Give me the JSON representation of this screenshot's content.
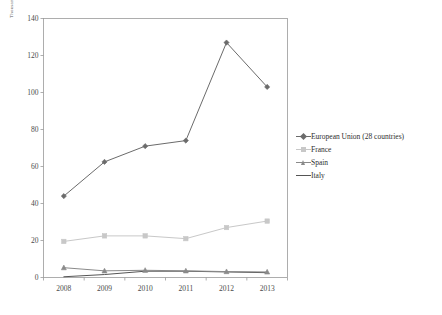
{
  "chart_data": {
    "type": "line",
    "title": "",
    "xlabel": "",
    "ylabel": "Thousands",
    "categories": [
      "2008",
      "2009",
      "2010",
      "2011",
      "2012",
      "2013"
    ],
    "ylim": [
      0,
      140
    ],
    "ytick_step": 20,
    "yticks": [
      "0",
      "20",
      "40",
      "60",
      "80",
      "100",
      "120",
      "140"
    ],
    "grid": false,
    "legend_position": "right",
    "series": [
      {
        "name": "European Union (28 countries)",
        "color": "#6b6b6b",
        "marker": "diamond",
        "values": [
          44,
          62.5,
          71,
          74,
          127,
          103
        ]
      },
      {
        "name": "France",
        "color": "#c8c8c8",
        "marker": "square",
        "values": [
          19.5,
          22.5,
          22.5,
          21,
          27,
          30.5
        ]
      },
      {
        "name": "Spain",
        "color": "#8a8a8a",
        "marker": "triangle",
        "values": [
          5.3,
          3.6,
          3.9,
          3.6,
          3.2,
          3.0
        ]
      },
      {
        "name": "Italy",
        "color": "#555555",
        "marker": "none",
        "values": [
          0.4,
          1.6,
          3.4,
          3.4,
          3.0,
          2.6
        ]
      }
    ]
  },
  "axes": {
    "unit_label": "Thousands"
  }
}
